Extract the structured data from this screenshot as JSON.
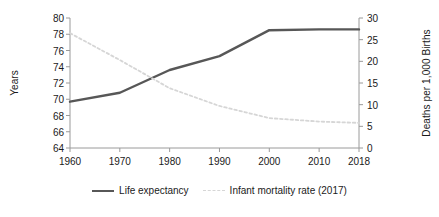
{
  "chart_data": {
    "type": "line",
    "title": "",
    "xlabel": "",
    "x": [
      1960,
      1970,
      1980,
      1990,
      2000,
      2010,
      2018
    ],
    "xticklabels": [
      "1960",
      "1970",
      "1980",
      "1990",
      "2000",
      "2010",
      "2018"
    ],
    "grid": false,
    "legend_position": "bottom",
    "axes": {
      "left": {
        "label": "Years",
        "ticks": [
          64,
          66,
          68,
          70,
          72,
          74,
          76,
          78,
          80
        ],
        "ticklabels": [
          "64",
          "66",
          "68",
          "70",
          "72",
          "74",
          "76",
          "78",
          "80"
        ],
        "ylim": [
          64,
          80
        ]
      },
      "right": {
        "label": "Deaths per 1,000 Births",
        "ticks": [
          0,
          5,
          10,
          15,
          20,
          25,
          30
        ],
        "ticklabels": [
          "0",
          "5",
          "10",
          "15",
          "20",
          "25",
          "30"
        ],
        "ylim": [
          0,
          30
        ]
      }
    },
    "series": [
      {
        "name": "Life expectancy",
        "axis": "left",
        "style": "solid",
        "color": "#575757",
        "values": [
          69.7,
          70.8,
          73.6,
          75.3,
          78.5,
          78.6,
          78.6
        ]
      },
      {
        "name": "Infant mortality rate (2017)",
        "axis": "right",
        "style": "dashed",
        "color": "#d6d6d6",
        "values": [
          26.5,
          20.3,
          13.8,
          9.7,
          6.9,
          6.1,
          5.8
        ]
      }
    ]
  },
  "legend": {
    "items": [
      {
        "label": "Life expectancy",
        "style": "solid"
      },
      {
        "label": "Infant mortality rate (2017)",
        "style": "dashed"
      }
    ]
  }
}
